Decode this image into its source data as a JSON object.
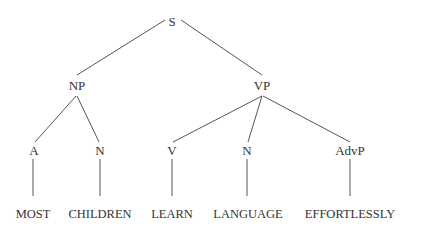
{
  "diagram": {
    "type": "syntax-tree",
    "nodes": {
      "s": {
        "label": "S",
        "x": 172,
        "y": 21
      },
      "np": {
        "label": "NP",
        "x": 77,
        "y": 85
      },
      "vp": {
        "label": "VP",
        "x": 262,
        "y": 85
      },
      "a": {
        "label": "A",
        "x": 34,
        "y": 150
      },
      "n1": {
        "label": "N",
        "x": 100,
        "y": 150
      },
      "v": {
        "label": "V",
        "x": 172,
        "y": 150
      },
      "n2": {
        "label": "N",
        "x": 247,
        "y": 150
      },
      "advp": {
        "label": "AdvP",
        "x": 350,
        "y": 150
      },
      "most": {
        "label": "MOST",
        "x": 33,
        "y": 214
      },
      "children": {
        "label": "CHILDREN",
        "x": 100,
        "y": 214
      },
      "learn": {
        "label": "LEARN",
        "x": 172,
        "y": 214
      },
      "language": {
        "label": "LANGUAGE",
        "x": 248,
        "y": 214
      },
      "effortlessly": {
        "label": "EFFORTLESSLY",
        "x": 350,
        "y": 214
      }
    },
    "edges": [
      {
        "from": "s",
        "to": "np",
        "x1": 165,
        "y1": 20,
        "x2": 77,
        "y2": 75
      },
      {
        "from": "s",
        "to": "vp",
        "x1": 181,
        "y1": 20,
        "x2": 262,
        "y2": 75
      },
      {
        "from": "np",
        "to": "a",
        "x1": 76,
        "y1": 96,
        "x2": 35,
        "y2": 142
      },
      {
        "from": "np",
        "to": "n1",
        "x1": 77,
        "y1": 96,
        "x2": 99,
        "y2": 142
      },
      {
        "from": "vp",
        "to": "v",
        "x1": 262,
        "y1": 96,
        "x2": 173,
        "y2": 142
      },
      {
        "from": "vp",
        "to": "n2",
        "x1": 262,
        "y1": 96,
        "x2": 248,
        "y2": 142
      },
      {
        "from": "vp",
        "to": "advp",
        "x1": 263,
        "y1": 96,
        "x2": 350,
        "y2": 142
      },
      {
        "from": "a",
        "to": "most",
        "x1": 33,
        "y1": 159,
        "x2": 33,
        "y2": 196
      },
      {
        "from": "n1",
        "to": "children",
        "x1": 100,
        "y1": 159,
        "x2": 100,
        "y2": 196
      },
      {
        "from": "v",
        "to": "learn",
        "x1": 172,
        "y1": 159,
        "x2": 172,
        "y2": 196
      },
      {
        "from": "n2",
        "to": "language",
        "x1": 247,
        "y1": 159,
        "x2": 247,
        "y2": 196
      },
      {
        "from": "advp",
        "to": "effortlessly",
        "x1": 350,
        "y1": 159,
        "x2": 350,
        "y2": 196
      }
    ]
  }
}
